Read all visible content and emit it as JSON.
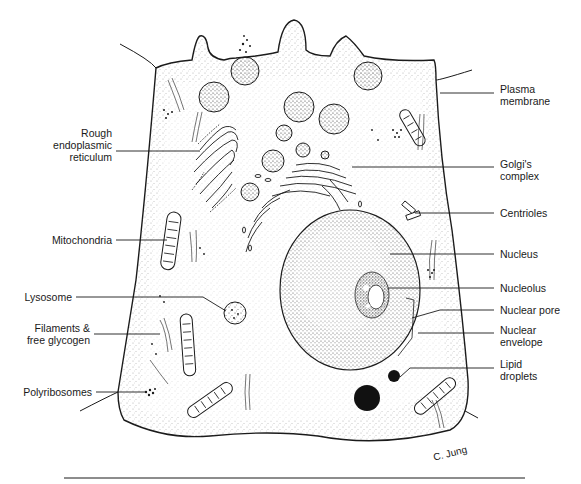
{
  "figure": {
    "signature": "C. Jung"
  },
  "labels_left": [
    {
      "id": "rough-er",
      "text": "Rough\nendoplasmic\nreticulum",
      "x": 8,
      "y": 127,
      "w": 104,
      "line": [
        [
          116,
          151
        ],
        [
          200,
          151
        ]
      ]
    },
    {
      "id": "mitochondria",
      "text": "Mitochondria",
      "x": 8,
      "y": 234,
      "w": 104,
      "line": [
        [
          116,
          240
        ],
        [
          167,
          240
        ]
      ]
    },
    {
      "id": "lysosome",
      "text": "Lysosome",
      "x": 8,
      "y": 291,
      "w": 64,
      "line": [
        [
          76,
          297
        ],
        [
          203,
          297
        ],
        [
          226,
          311
        ]
      ]
    },
    {
      "id": "filaments",
      "text": "Filaments &\nfree glycogen",
      "x": 8,
      "y": 324,
      "w": 82,
      "line": [
        [
          94,
          334
        ],
        [
          160,
          334
        ]
      ]
    },
    {
      "id": "polyribosomes",
      "text": "Polyribosomes",
      "x": 8,
      "y": 386,
      "w": 84,
      "line": [
        [
          96,
          392
        ],
        [
          145,
          392
        ]
      ]
    }
  ],
  "labels_right": [
    {
      "id": "plasma-membrane",
      "text": "Plasma\nmembrane",
      "x": 500,
      "y": 83,
      "line": [
        [
          440,
          93
        ],
        [
          494,
          93
        ]
      ]
    },
    {
      "id": "golgi",
      "text": "Golgi's\ncomplex",
      "x": 500,
      "y": 158,
      "line": [
        [
          352,
          167
        ],
        [
          494,
          167
        ]
      ]
    },
    {
      "id": "centrioles",
      "text": "Centrioles",
      "x": 500,
      "y": 208,
      "line": [
        [
          415,
          213
        ],
        [
          494,
          213
        ]
      ]
    },
    {
      "id": "nucleus",
      "text": "Nucleus",
      "x": 500,
      "y": 248,
      "line": [
        [
          390,
          254
        ],
        [
          494,
          254
        ]
      ]
    },
    {
      "id": "nucleolus",
      "text": "Nucleolus",
      "x": 500,
      "y": 282,
      "line": [
        [
          388,
          288
        ],
        [
          494,
          288
        ]
      ]
    },
    {
      "id": "nuclear-pore",
      "text": "Nuclear pore",
      "x": 500,
      "y": 304,
      "line": [
        [
          412,
          318
        ],
        [
          440,
          310
        ],
        [
          494,
          310
        ]
      ]
    },
    {
      "id": "nuclear-envelope",
      "text": "Nuclear\nenvelope",
      "x": 500,
      "y": 324,
      "line": [
        [
          418,
          333
        ],
        [
          494,
          333
        ]
      ]
    },
    {
      "id": "lipid-droplets",
      "text": "Lipid\ndroplets",
      "x": 500,
      "y": 358,
      "line": [
        [
          400,
          377
        ],
        [
          410,
          368
        ],
        [
          494,
          368
        ]
      ]
    }
  ],
  "colors": {
    "ink": "#1a1a1a",
    "stipple": "#555555",
    "background": "#ffffff"
  }
}
